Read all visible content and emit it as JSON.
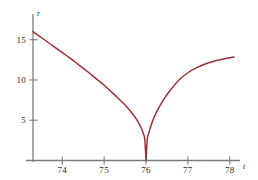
{
  "chart_data": {
    "type": "line",
    "title": "",
    "subtitle": "",
    "xlabel": "t",
    "ylabel": "r",
    "xlim": [
      73.3,
      78.15
    ],
    "ylim": [
      0,
      17.2
    ],
    "xticks": [
      74,
      75,
      76,
      77,
      78
    ],
    "xtick_labels": [
      "74",
      "75",
      "76",
      "77",
      "78"
    ],
    "yticks": [
      5,
      10,
      15
    ],
    "ytick_labels": [
      "5",
      "10",
      "15"
    ],
    "grid": false,
    "legend": null,
    "annotations": [],
    "curve_color": "#9c2f33",
    "axis_color": "#7b7b7b",
    "series": [
      {
        "name": "r(t)",
        "description": "cusp curve with minimum r = 0 at t = 76",
        "x": [
          73.3,
          73.45,
          73.6,
          73.8,
          74.0,
          74.2,
          74.4,
          74.6,
          74.8,
          75.0,
          75.2,
          75.4,
          75.55,
          75.7,
          75.8,
          75.88,
          75.94,
          75.97,
          76.0,
          76.03,
          76.06,
          76.12,
          76.2,
          76.3,
          76.45,
          76.6,
          76.8,
          77.0,
          77.2,
          77.4,
          77.6,
          77.8,
          78.0,
          78.1
        ],
        "y": [
          16.0,
          15.45,
          14.9,
          14.15,
          13.4,
          12.65,
          11.85,
          11.05,
          10.2,
          9.35,
          8.4,
          7.4,
          6.6,
          5.65,
          4.9,
          4.1,
          3.3,
          2.65,
          0.0,
          2.65,
          3.3,
          4.35,
          5.45,
          6.5,
          7.8,
          8.85,
          10.05,
          10.9,
          11.5,
          11.95,
          12.3,
          12.55,
          12.75,
          12.85
        ]
      }
    ]
  },
  "axes": {
    "y_axis_label": "r",
    "x_axis_label": "t"
  }
}
